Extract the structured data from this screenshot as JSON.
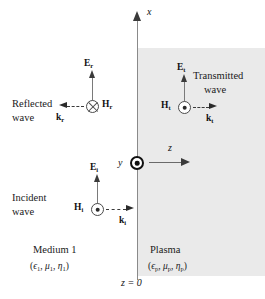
{
  "figure": {
    "type": "electromagnetic-wave-boundary-diagram"
  },
  "axes": {
    "x_label": "x",
    "y_label": "y",
    "z_label": "z",
    "y_symbol": "dot-in-circle-out-of-page",
    "boundary_label": "z = 0"
  },
  "regions": {
    "left": {
      "name": "Medium 1",
      "parameters_open": "(",
      "epsilon": "ϵ",
      "epsilon_sub": "1",
      "mu": "μ",
      "mu_sub": "1",
      "eta": "η",
      "eta_sub": "1",
      "fill_color": "#ffffff"
    },
    "right": {
      "name": "Plasma",
      "epsilon": "ϵ",
      "epsilon_sub": "p",
      "mu": "μ",
      "mu_sub": "p",
      "eta": "η",
      "eta_sub": "p",
      "fill_color": "#eaeaea"
    }
  },
  "waves": [
    {
      "id": "reflected",
      "label_line1": "Reflected",
      "label_line2": "wave",
      "e_field": "E",
      "e_sub": "r",
      "h_field": "H",
      "h_sub": "r",
      "h_symbol": "cross-in-circle-into-page",
      "k_vector": "k",
      "k_sub": "r",
      "k_direction": "left"
    },
    {
      "id": "incident",
      "label_line1": "Incident",
      "label_line2": "wave",
      "e_field": "E",
      "e_sub": "i",
      "h_field": "H",
      "h_sub": "i",
      "h_symbol": "dot-in-circle-out-of-page",
      "k_vector": "k",
      "k_sub": "i",
      "k_direction": "right"
    },
    {
      "id": "transmitted",
      "label_line1": "Transmitted",
      "label_line2": "wave",
      "e_field": "E",
      "e_sub": "t",
      "h_field": "H",
      "h_sub": "t",
      "h_symbol": "dot-in-circle-out-of-page",
      "k_vector": "k",
      "k_sub": "t",
      "k_direction": "right"
    }
  ],
  "colors": {
    "background": "#ffffff",
    "plasma_fill": "#eaeaea",
    "axis": "#8a8a8a",
    "arrow": "#2a2a2a",
    "text": "#1a1a1a"
  }
}
